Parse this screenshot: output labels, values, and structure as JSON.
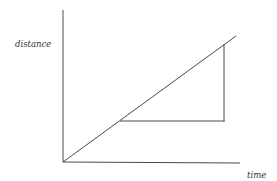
{
  "diagram": {
    "type": "distance-time graph",
    "y_axis_label": "distance",
    "x_axis_label": "time",
    "line_color": "#4a4a4a",
    "elements": [
      {
        "name": "y-axis",
        "from": [
          63,
          10
        ],
        "to": [
          63,
          162
        ]
      },
      {
        "name": "x-axis",
        "from": [
          63,
          162
        ],
        "to": [
          240,
          163
        ]
      },
      {
        "name": "distance-time-line",
        "from": [
          63,
          162
        ],
        "to": [
          236,
          36
        ]
      },
      {
        "name": "gradient-triangle-horizontal",
        "from": [
          120,
          121
        ],
        "to": [
          224,
          121
        ]
      },
      {
        "name": "gradient-triangle-vertical",
        "from": [
          224,
          43
        ],
        "to": [
          224,
          121
        ]
      }
    ]
  }
}
